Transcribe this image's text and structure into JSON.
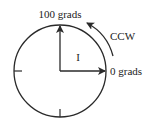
{
  "diagram": {
    "labels": {
      "top": "100 grads",
      "right": "0 grads",
      "direction": "CCW",
      "quadrant": "I"
    },
    "colors": {
      "stroke": "#2a2a2a",
      "background": "#ffffff"
    }
  }
}
